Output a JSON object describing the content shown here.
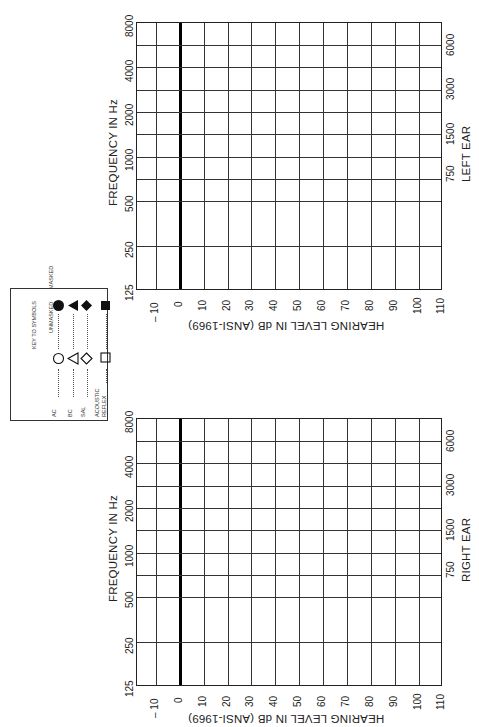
{
  "form": "Audiogram",
  "legend": {
    "title": "KEY TO SYMBOLS",
    "col_unmasked": "UNMASKED",
    "col_masked": "MASKED",
    "rows": [
      {
        "label": "AC",
        "unmasked": "circle-open",
        "masked": "circle-filled"
      },
      {
        "label": "BC",
        "unmasked": "triangle-open",
        "masked": "triangle-filled"
      },
      {
        "label": "SAL",
        "unmasked": "diamond-open",
        "masked": "diamond-filled"
      },
      {
        "label": "ACOUSTIC",
        "label2": "REFLEX",
        "unmasked": "square-open",
        "masked": "square-filled"
      }
    ]
  },
  "charts": [
    {
      "ear": "LEFT EAR",
      "freq_title": "FREQUENCY IN Hz",
      "level_title": "HEARING LEVEL IN dB (ANSI-1969)",
      "octave_freqs": [
        "125",
        "250",
        "500",
        "1000",
        "2000",
        "4000",
        "8000"
      ],
      "mid_freqs": [
        "750",
        "1500",
        "3000",
        "6000"
      ],
      "db_levels": [
        "– 10",
        "0",
        "10",
        "20",
        "30",
        "40",
        "50",
        "60",
        "70",
        "80",
        "90",
        "100",
        "110"
      ]
    },
    {
      "ear": "RIGHT EAR",
      "freq_title": "FREQUENCY IN Hz",
      "level_title": "HEARING LEVEL IN dB (ANSI-1969)",
      "octave_freqs": [
        "125",
        "250",
        "500",
        "1000",
        "2000",
        "4000",
        "8000"
      ],
      "mid_freqs": [
        "750",
        "1500",
        "3000",
        "6000"
      ],
      "db_levels": [
        "– 10",
        "0",
        "10",
        "20",
        "30",
        "40",
        "50",
        "60",
        "70",
        "80",
        "90",
        "100",
        "110"
      ]
    }
  ],
  "colors": {
    "ink": "#222222",
    "paper": "#ffffff"
  }
}
